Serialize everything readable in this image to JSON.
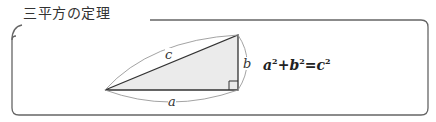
{
  "box": {
    "title": "三平方の定理"
  },
  "figure": {
    "label_hypotenuse": "c",
    "label_vertical": "b",
    "label_base": "a",
    "fill_color": "#ebebeb",
    "stroke_color": "#333333"
  },
  "formula": {
    "a": "a",
    "a_exp": "2",
    "plus": "+",
    "b": "b",
    "b_exp": "2",
    "eq": "=",
    "c": "c",
    "c_exp": "2"
  }
}
